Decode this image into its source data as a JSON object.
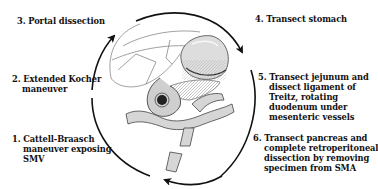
{
  "diagram": {
    "type": "cyclic-process",
    "steps": [
      {
        "number": "1.",
        "lines": [
          "Cattell-Braasch",
          "maneuver exposing",
          "SMV"
        ]
      },
      {
        "number": "2.",
        "lines": [
          "Extended Kocher",
          "maneuver"
        ]
      },
      {
        "number": "3.",
        "lines": [
          "Portal dissection"
        ]
      },
      {
        "number": "4.",
        "lines": [
          "Transect stomach"
        ]
      },
      {
        "number": "5.",
        "lines": [
          "Transect jejunum and",
          "dissect ligament of",
          "Treitz, rotating",
          "duodenum under",
          "mesenteric vessels"
        ]
      },
      {
        "number": "6.",
        "lines": [
          "Transect pancreas and",
          "complete retroperitoneal",
          "dissection by removing",
          "specimen from SMA"
        ]
      }
    ],
    "flow_direction": "clockwise",
    "illustration": "anatomical drawing of liver, stomach, duodenum, pancreas and small bowel",
    "colors": {
      "ink": "#111111",
      "illustration_line": "#777777",
      "background": "#ffffff"
    }
  }
}
